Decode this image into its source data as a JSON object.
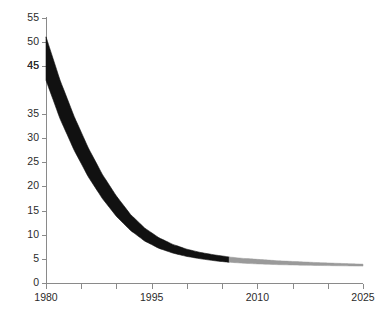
{
  "chart_data": {
    "type": "area",
    "title": "",
    "xlabel": "",
    "ylabel": "COE cents/kwh (2005$)",
    "xlim": [
      1980,
      2025
    ],
    "ylim": [
      0,
      55
    ],
    "grid": false,
    "legend": "none",
    "x_ticks_major": [
      1980,
      1995,
      2010,
      2025
    ],
    "x_ticks_minor": [
      1985,
      1990,
      2000,
      2005,
      2015,
      2020
    ],
    "y_ticks": [
      0,
      5,
      10,
      15,
      20,
      25,
      30,
      35,
      45,
      45,
      50,
      55
    ],
    "y_tick_labels": [
      "0",
      "5",
      "10",
      "15",
      "20",
      "25",
      "30",
      "35",
      "45",
      "45",
      "50",
      "55"
    ],
    "historical_color": "#111111",
    "projected_color": "#9a9a9a",
    "split_year": 2006,
    "series": [
      {
        "name": "COE upper bound",
        "x": [
          1980,
          1982,
          1984,
          1986,
          1988,
          1990,
          1992,
          1994,
          1996,
          1998,
          2000,
          2002,
          2004,
          2006,
          2008,
          2010,
          2013,
          2016,
          2019,
          2022,
          2025
        ],
        "values": [
          51.0,
          42.0,
          34.5,
          28.0,
          22.5,
          18.0,
          14.2,
          11.4,
          9.4,
          8.0,
          7.0,
          6.3,
          5.8,
          5.4,
          5.1,
          4.9,
          4.6,
          4.4,
          4.2,
          4.05,
          3.9
        ]
      },
      {
        "name": "COE lower bound",
        "x": [
          1980,
          1982,
          1984,
          1986,
          1988,
          1990,
          1992,
          1994,
          1996,
          1998,
          2000,
          2002,
          2004,
          2006,
          2008,
          2010,
          2013,
          2016,
          2019,
          2022,
          2025
        ],
        "values": [
          42.0,
          34.0,
          27.5,
          22.0,
          17.5,
          13.8,
          10.9,
          8.7,
          7.2,
          6.2,
          5.5,
          5.0,
          4.6,
          4.3,
          4.1,
          3.95,
          3.8,
          3.7,
          3.62,
          3.56,
          3.5
        ]
      }
    ]
  },
  "axes": {
    "y_title": "COE cents/kwh (2005$)"
  }
}
